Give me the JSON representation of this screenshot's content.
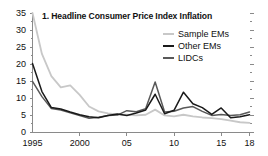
{
  "chart_data": {
    "type": "line",
    "title": "1. Headline Consumer Price Index Inflation",
    "xlabel": "",
    "ylabel": "",
    "xlim": [
      1995,
      2018
    ],
    "ylim": [
      0,
      35
    ],
    "grid": false,
    "legend_position": "top-right",
    "y_ticks": [
      0,
      5,
      10,
      15,
      20,
      25,
      30,
      35
    ],
    "y_tick_labels": [
      "0",
      "5",
      "10",
      "15",
      "20",
      "25",
      "30",
      "35"
    ],
    "x_ticks": [
      1995,
      2000,
      2005,
      2010,
      2015,
      2018
    ],
    "x_tick_labels": [
      "1995",
      "2000",
      "05",
      "10",
      "15",
      "18"
    ],
    "x": [
      1995,
      1996,
      1997,
      1998,
      1999,
      2000,
      2001,
      2002,
      2003,
      2004,
      2005,
      2006,
      2007,
      2008,
      2009,
      2010,
      2011,
      2012,
      2013,
      2014,
      2015,
      2016,
      2017,
      2018
    ],
    "series": [
      {
        "name": "Sample EMs",
        "color": "#c8c8c8",
        "values": [
          35.0,
          23.0,
          16.5,
          13.2,
          13.8,
          11.0,
          7.6,
          6.2,
          5.6,
          5.3,
          5.2,
          5.0,
          5.2,
          6.7,
          5.0,
          4.7,
          5.2,
          4.7,
          4.4,
          4.2,
          3.9,
          3.5,
          3.0,
          2.8
        ]
      },
      {
        "name": "Other EMs",
        "color": "#1a1a1a",
        "values": [
          20.2,
          12.0,
          7.3,
          6.9,
          6.0,
          5.2,
          4.6,
          4.3,
          5.0,
          5.4,
          5.0,
          5.7,
          6.6,
          11.2,
          5.5,
          6.5,
          11.8,
          8.4,
          7.3,
          5.3,
          7.2,
          4.3,
          4.6,
          5.2
        ]
      },
      {
        "name": "LIDCs",
        "color": "#595959",
        "values": [
          15.0,
          10.5,
          7.0,
          6.6,
          5.8,
          5.0,
          4.2,
          4.5,
          5.0,
          5.1,
          6.4,
          6.1,
          7.0,
          14.8,
          6.0,
          6.2,
          7.2,
          7.6,
          6.2,
          5.0,
          5.3,
          5.0,
          5.2,
          6.0
        ]
      }
    ]
  },
  "legend": {
    "items": [
      {
        "label": "Sample EMs",
        "color": "#c8c8c8"
      },
      {
        "label": "Other EMs",
        "color": "#1a1a1a"
      },
      {
        "label": "LIDCs",
        "color": "#595959"
      }
    ]
  },
  "axes": {
    "axis_color": "#8a8a8a"
  }
}
